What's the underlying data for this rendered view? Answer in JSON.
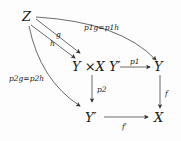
{
  "diagram": {
    "type": "commutative-diagram",
    "nodes": {
      "Z": "Z",
      "P": "Y ×X Y′",
      "Y": "Y",
      "Yp": "Y′",
      "X": "X"
    },
    "arrows": {
      "g": "g",
      "h": "h",
      "p1": "p1",
      "p2": "p2",
      "f": "f",
      "fp": "f′",
      "top_curve": "p1g=p1h",
      "left_curve": "p2g=p2h"
    }
  }
}
